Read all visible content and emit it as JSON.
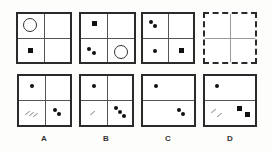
{
  "puzzle": {
    "question_row": [
      {
        "id": "panel-1",
        "border": "solid",
        "dividers": [
          "vertical",
          "horizontal"
        ],
        "contents": {
          "top_left": "circle",
          "bottom_left": "square",
          "top_right": "",
          "bottom_right": ""
        }
      },
      {
        "id": "panel-2",
        "border": "solid",
        "dividers": [
          "vertical",
          "horizontal"
        ],
        "contents": {
          "top_left": "square",
          "bottom_left": "2 dots",
          "top_right": "",
          "bottom_right": "circle"
        }
      },
      {
        "id": "panel-3",
        "border": "solid",
        "dividers": [
          "vertical",
          "horizontal"
        ],
        "contents": {
          "top_left": "2 dots",
          "bottom_left": "1 dot",
          "top_right": "",
          "bottom_right": "square"
        }
      },
      {
        "id": "panel-4",
        "border": "dashed",
        "dividers": [
          "vertical",
          "horizontal"
        ],
        "contents": {
          "note": "missing panel (?)"
        }
      }
    ],
    "options": [
      {
        "label": "A",
        "dividers": [
          "vertical",
          "horizontal"
        ],
        "contents": {
          "top_left": "1 dot",
          "bottom_left": "3 hatch lines",
          "bottom_right": "2 dots"
        }
      },
      {
        "label": "B",
        "dividers": [
          "vertical",
          "horizontal"
        ],
        "contents": {
          "top_left": "1 dot",
          "bottom_left": "1 hatch line",
          "bottom_right": "3 dots"
        }
      },
      {
        "label": "C",
        "dividers": [
          "horizontal"
        ],
        "contents": {
          "top_left": "1 dot",
          "bottom_right": "2 dots"
        }
      },
      {
        "label": "D",
        "dividers": [
          "horizontal"
        ],
        "contents": {
          "top_left": "1 dot",
          "bottom_left": "2 hatch lines",
          "bottom_right": "2 squares"
        }
      }
    ]
  },
  "colors": {
    "stroke": "#2a2a2a",
    "fill": "#111111",
    "hatch": "#9a9a9a",
    "background": "#fdfdfb"
  }
}
